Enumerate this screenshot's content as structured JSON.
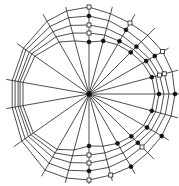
{
  "diagram": {
    "type": "polar-web",
    "center": [
      89,
      94
    ],
    "colors": {
      "line": "#222222",
      "filled_marker": "#111111",
      "open_marker": "#ffffff",
      "background": "#ffffff"
    },
    "spoke_angles_deg": [
      90,
      75,
      60,
      45,
      30,
      15,
      0,
      -15,
      -30,
      -45,
      -60,
      -75,
      -90,
      -105,
      -120,
      -145,
      -170,
      170,
      145,
      120,
      105
    ],
    "spoke_lengths": [
      89,
      90,
      92,
      93,
      92,
      92,
      92,
      92,
      92,
      92,
      92,
      90,
      90,
      92,
      95,
      92,
      84,
      84,
      88,
      92,
      90
    ],
    "rings": [
      {
        "radii": [
          87,
          83,
          82,
          83,
          85,
          86,
          86,
          85,
          84,
          83,
          84,
          84,
          86,
          87,
          88,
          82,
          78,
          78,
          80,
          84,
          86
        ],
        "markers": "open-filled"
      },
      {
        "radii": [
          78,
          76,
          74,
          74,
          76,
          78,
          80,
          79,
          77,
          75,
          75,
          76,
          77,
          79,
          80,
          78,
          75,
          75,
          77,
          78,
          79
        ],
        "markers": "filled"
      },
      {
        "radii": [
          69,
          68,
          67,
          67,
          70,
          73,
          75,
          74,
          72,
          69,
          68,
          68,
          69,
          71,
          73,
          74,
          72,
          72,
          73,
          72,
          71
        ],
        "markers": "open"
      },
      {
        "radii": [
          61,
          61,
          61,
          63,
          66,
          69,
          70,
          69,
          67,
          64,
          62,
          61,
          61,
          64,
          68,
          71,
          70,
          70,
          70,
          66,
          63
        ],
        "markers": "open"
      },
      {
        "radii": [
          52,
          55,
          57,
          59,
          62,
          65,
          66,
          65,
          63,
          60,
          57,
          54,
          52,
          58,
          64,
          68,
          67,
          67,
          66,
          60,
          55
        ],
        "markers": "filled"
      }
    ],
    "marker_nodes": [
      {
        "ring": 0,
        "spoke": 0,
        "kind": "open"
      },
      {
        "ring": 0,
        "spoke": 2,
        "kind": "open"
      },
      {
        "ring": 0,
        "spoke": 4,
        "kind": "open"
      },
      {
        "ring": 0,
        "spoke": 6,
        "kind": "filled"
      },
      {
        "ring": 0,
        "spoke": 8,
        "kind": "filled"
      },
      {
        "ring": 0,
        "spoke": 10,
        "kind": "filled"
      },
      {
        "ring": 0,
        "spoke": 11,
        "kind": "open"
      },
      {
        "ring": 0,
        "spoke": 12,
        "kind": "open"
      },
      {
        "ring": 1,
        "spoke": 0,
        "kind": "filled"
      },
      {
        "ring": 1,
        "spoke": 2,
        "kind": "filled"
      },
      {
        "ring": 1,
        "spoke": 4,
        "kind": "filled"
      },
      {
        "ring": 1,
        "spoke": 5,
        "kind": "open"
      },
      {
        "ring": 1,
        "spoke": 9,
        "kind": "open"
      },
      {
        "ring": 1,
        "spoke": 12,
        "kind": "filled"
      },
      {
        "ring": 2,
        "spoke": 0,
        "kind": "open"
      },
      {
        "ring": 2,
        "spoke": 3,
        "kind": "filled"
      },
      {
        "ring": 2,
        "spoke": 5,
        "kind": "open"
      },
      {
        "ring": 2,
        "spoke": 9,
        "kind": "filled"
      },
      {
        "ring": 2,
        "spoke": 12,
        "kind": "open"
      },
      {
        "ring": 3,
        "spoke": 0,
        "kind": "open"
      },
      {
        "ring": 3,
        "spoke": 2,
        "kind": "filled"
      },
      {
        "ring": 3,
        "spoke": 4,
        "kind": "filled"
      },
      {
        "ring": 3,
        "spoke": 6,
        "kind": "filled"
      },
      {
        "ring": 3,
        "spoke": 8,
        "kind": "filled"
      },
      {
        "ring": 3,
        "spoke": 12,
        "kind": "open"
      },
      {
        "ring": 4,
        "spoke": 0,
        "kind": "filled"
      },
      {
        "ring": 4,
        "spoke": 1,
        "kind": "filled"
      },
      {
        "ring": 4,
        "spoke": 3,
        "kind": "filled"
      },
      {
        "ring": 4,
        "spoke": 5,
        "kind": "filled"
      },
      {
        "ring": 4,
        "spoke": 7,
        "kind": "filled"
      },
      {
        "ring": 4,
        "spoke": 9,
        "kind": "filled"
      },
      {
        "ring": 4,
        "spoke": 10,
        "kind": "filled"
      },
      {
        "ring": 4,
        "spoke": 12,
        "kind": "filled"
      }
    ]
  }
}
